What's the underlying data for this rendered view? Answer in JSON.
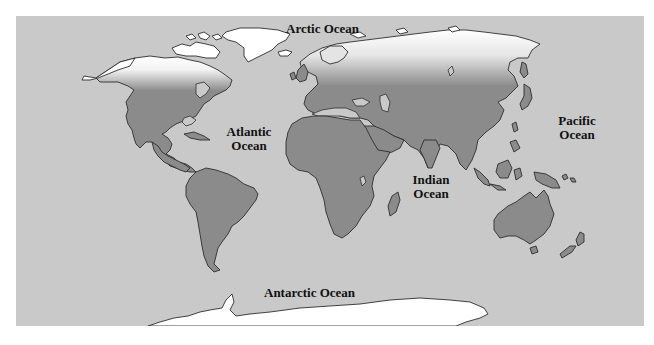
{
  "map": {
    "type": "world-map",
    "style": "grayscale",
    "colors": {
      "ocean": "#c9c9c9",
      "land": "#8b8b8b",
      "ice": "#ffffff",
      "coastline": "#2e2e2e",
      "label": "#111111"
    },
    "labels": {
      "arctic": "Arctic Ocean",
      "atlantic_line1": "Atlantic",
      "atlantic_line2": "Ocean",
      "pacific_line1": "Pacific",
      "pacific_line2": "Ocean",
      "indian_line1": "Indian",
      "indian_line2": "Ocean",
      "antarctic": "Antarctic Ocean"
    }
  }
}
